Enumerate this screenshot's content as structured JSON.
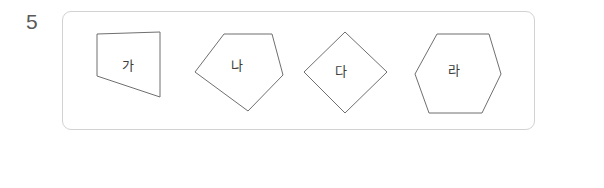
{
  "question": {
    "number": "5",
    "answer_blank": {
      "open_paren": "(",
      "close_paren": ")"
    }
  },
  "figures": [
    {
      "id": "quadrilateral",
      "label": "가",
      "shape": "quadrilateral",
      "points": "8,22 71,20 71,85 8,64",
      "label_left": "33px",
      "label_top": "47px"
    },
    {
      "id": "pentagon",
      "label": "나",
      "shape": "pentagon",
      "points": "33,22 81,22 92,63 57,99 4,60",
      "label_left": "40px",
      "label_top": "47px"
    },
    {
      "id": "diamond",
      "label": "다",
      "shape": "diamond",
      "points": "44,20 86,60 44,101 3,60",
      "label_left": "34px",
      "label_top": "53px"
    },
    {
      "id": "hexagon",
      "label": "라",
      "shape": "hexagon",
      "points": "26,22 78,22 90,62 71,101 18,101 4,62",
      "label_left": "37px",
      "label_top": "52px"
    }
  ],
  "colors": {
    "panel_border": "#d2d2d2",
    "shape_stroke": "#6f6f6f",
    "text": "#4a4a4a",
    "background": "#ffffff"
  }
}
